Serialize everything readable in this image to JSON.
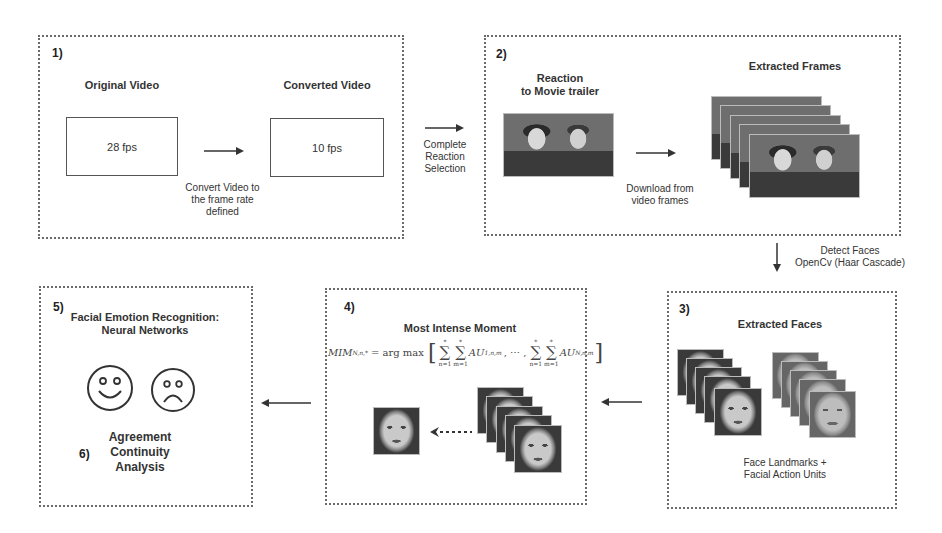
{
  "step1": {
    "number": "1)",
    "original_label": "Original Video",
    "original_fps": "28 fps",
    "converted_label": "Converted Video",
    "converted_fps": "10 fps",
    "convert_caption": [
      "Convert Video to",
      "the frame rate",
      "defined"
    ]
  },
  "transition_1_2": [
    "Complete",
    "Reaction",
    "Selection"
  ],
  "step2": {
    "number": "2)",
    "reaction_label": [
      "Reaction",
      "to Movie trailer"
    ],
    "download_caption": [
      "Download from",
      "video frames"
    ],
    "frames_label": "Extracted Frames"
  },
  "transition_2_3": [
    "Detect Faces",
    "OpenCv (Haar Cascade)"
  ],
  "step3": {
    "number": "3)",
    "title": "Extracted Faces",
    "caption": [
      "Face Landmarks +",
      "Facial Action Units"
    ]
  },
  "step4": {
    "number": "4)",
    "title": "Most Intense Moment",
    "formula": {
      "lhs": "MIM",
      "lhs_sub": "N,n,*",
      "op": "= arg max",
      "term1": "AU",
      "term1_sub": "1,n,m",
      "ellipsis": ", ⋯ ,",
      "term2": "AU",
      "term2_sub": "N,n,m",
      "sum_n_lower": "n=1",
      "sum_m_lower": "m=1",
      "sum_upper": "*"
    }
  },
  "step5": {
    "number": "5)",
    "title": [
      "Facial Emotion Recognition:",
      "Neural Networks"
    ]
  },
  "step6": {
    "number": "6)",
    "title": [
      "Agreement",
      "Continuity",
      "Analysis"
    ]
  },
  "colors": {
    "border": "#6a6a6a",
    "text": "#333333",
    "arrow": "#333333"
  }
}
